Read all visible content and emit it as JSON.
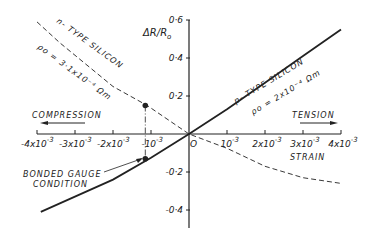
{
  "chart_data": {
    "type": "line",
    "title": "",
    "xlabel": "STRAIN",
    "ylabel": "ΔR/R₀",
    "xlim": [
      -0.004,
      0.004
    ],
    "ylim": [
      -0.45,
      0.6
    ],
    "grid": false,
    "x_ticks": [
      {
        "value": -0.004,
        "base": "-4x10",
        "exp": "-3"
      },
      {
        "value": -0.003,
        "base": "-3x10",
        "exp": "-3"
      },
      {
        "value": -0.002,
        "base": "-2x10",
        "exp": "-3"
      },
      {
        "value": -0.001,
        "base": "-10",
        "exp": "-3"
      },
      {
        "value": 0.001,
        "base": "10",
        "exp": "-3"
      },
      {
        "value": 0.002,
        "base": "2x10",
        "exp": "-3"
      },
      {
        "value": 0.003,
        "base": "3x10",
        "exp": "-3"
      },
      {
        "value": 0.004,
        "base": "4x10",
        "exp": "-3"
      }
    ],
    "y_ticks": [
      {
        "value": 0.6,
        "label": "0·6"
      },
      {
        "value": 0.4,
        "label": "0·4"
      },
      {
        "value": 0.2,
        "label": "0·2"
      },
      {
        "value": -0.2,
        "label": "-0·2"
      },
      {
        "value": -0.4,
        "label": "-0·4"
      }
    ],
    "origin_label": "O",
    "series": [
      {
        "name": "p-TYPE SILICON",
        "sublabel": "ρ₀ = 2x10⁻⁴ Ωm",
        "style": "solid",
        "x": [
          -0.0039,
          -0.002,
          -0.001,
          0,
          0.001,
          0.002,
          0.003,
          0.004
        ],
        "y": [
          -0.41,
          -0.24,
          -0.125,
          0,
          0.13,
          0.27,
          0.41,
          0.55
        ]
      },
      {
        "name": "n-TYPE SILICON",
        "sublabel": "ρ₀ = 3·1x10⁻⁴ Ωm",
        "style": "dashed",
        "x": [
          -0.004,
          -0.0034,
          -0.002,
          -0.0011,
          0,
          0.001,
          0.002,
          0.003,
          0.004
        ],
        "y": [
          0.59,
          0.48,
          0.25,
          0.15,
          0,
          -0.075,
          -0.17,
          -0.23,
          -0.26
        ]
      }
    ],
    "markers": [
      {
        "x": -0.00115,
        "y": 0.15,
        "series": "n-TYPE SILICON"
      },
      {
        "x": -0.00115,
        "y": -0.13,
        "series": "p-TYPE SILICON"
      }
    ],
    "annotations": [
      {
        "text": "COMPRESSION",
        "arrow": "left"
      },
      {
        "text": "TENSION",
        "arrow": "right"
      },
      {
        "text": "BONDED GAUGE CONDITION",
        "points_to": "p-type marker at -10⁻³"
      }
    ]
  },
  "labels": {
    "ylabel_main": "ΔR/R",
    "ylabel_sub": "o",
    "xlabel": "STRAIN",
    "compression": "COMPRESSION",
    "tension": "TENSION",
    "bonded1": "BONDED GAUGE",
    "bonded2": "CONDITION",
    "ntype_name": "n- TYPE SILICON",
    "ntype_rho": "ρo = 3·1x10⁻⁴ Ωm",
    "ptype_name": "p- TYPE SILICON",
    "ptype_rho": "ρo = 2x10⁻⁴ Ωm"
  },
  "colors": {
    "ink": "#222222",
    "background": "#ffffff"
  }
}
